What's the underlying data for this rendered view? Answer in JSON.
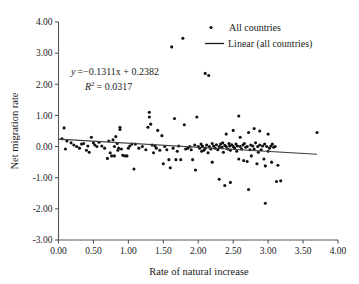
{
  "chart_data": {
    "type": "scatter",
    "title": "",
    "xlabel": "Rate of natural increase",
    "ylabel": "Net migration rate",
    "xlim": [
      0.0,
      4.0
    ],
    "ylim": [
      -3.0,
      4.0
    ],
    "xticks": [
      "0.00",
      "0.50",
      "1.00",
      "1.50",
      "2.00",
      "2.50",
      "3.00",
      "3.50",
      "4.00"
    ],
    "yticks": [
      "4.00",
      "3.00",
      "2.00",
      "1.00",
      "0.00",
      "-1.00",
      "-2.00",
      "-3.00"
    ],
    "grid": false,
    "legend_position": "top-right",
    "annotations": {
      "equation": "y = −0.1311x + 0.2382",
      "equation_y_var": "y",
      "equation_body": "=−0.1311x + 0.2382",
      "r_squared_var": "R",
      "r_squared_sup": "2",
      "r_squared_body": "= 0.0317",
      "r_squared": "R² = 0.0317"
    },
    "series": [
      {
        "name": "All countries",
        "marker": "point",
        "color": "#111111",
        "points": [
          [
            0.05,
            0.25
          ],
          [
            0.08,
            0.6
          ],
          [
            0.1,
            -0.08
          ],
          [
            0.12,
            0.18
          ],
          [
            0.18,
            0.12
          ],
          [
            0.22,
            0.05
          ],
          [
            0.26,
            0.0
          ],
          [
            0.3,
            -0.05
          ],
          [
            0.33,
            0.08
          ],
          [
            0.36,
            0.1
          ],
          [
            0.4,
            -0.12
          ],
          [
            0.42,
            0.02
          ],
          [
            0.44,
            -0.18
          ],
          [
            0.47,
            0.3
          ],
          [
            0.5,
            0.12
          ],
          [
            0.52,
            0.05
          ],
          [
            0.55,
            0.0
          ],
          [
            0.58,
            0.14
          ],
          [
            0.62,
            0.02
          ],
          [
            0.66,
            -0.05
          ],
          [
            0.7,
            -0.38
          ],
          [
            0.72,
            0.18
          ],
          [
            0.74,
            -0.2
          ],
          [
            0.76,
            -0.3
          ],
          [
            0.78,
            0.22
          ],
          [
            0.8,
            0.0
          ],
          [
            0.8,
            -0.3
          ],
          [
            0.82,
            0.32
          ],
          [
            0.84,
            0.1
          ],
          [
            0.85,
            -0.12
          ],
          [
            0.86,
            -0.05
          ],
          [
            0.88,
            0.62
          ],
          [
            0.88,
            0.55
          ],
          [
            0.9,
            -0.08
          ],
          [
            0.92,
            -0.28
          ],
          [
            0.95,
            -0.3
          ],
          [
            0.98,
            -0.3
          ],
          [
            1.0,
            -0.05
          ],
          [
            1.02,
            0.02
          ],
          [
            1.05,
            0.08
          ],
          [
            1.08,
            -0.72
          ],
          [
            1.1,
            0.08
          ],
          [
            1.15,
            -0.05
          ],
          [
            1.2,
            0.0
          ],
          [
            1.25,
            -0.1
          ],
          [
            1.28,
            0.62
          ],
          [
            1.3,
            1.1
          ],
          [
            1.3,
            0.95
          ],
          [
            1.32,
            0.72
          ],
          [
            1.34,
            0.05
          ],
          [
            1.36,
            -0.2
          ],
          [
            1.38,
            0.02
          ],
          [
            1.4,
            -0.05
          ],
          [
            1.42,
            0.52
          ],
          [
            1.45,
            -0.12
          ],
          [
            1.48,
            0.35
          ],
          [
            1.5,
            -0.55
          ],
          [
            1.52,
            0.0
          ],
          [
            1.55,
            -0.1
          ],
          [
            1.58,
            -0.42
          ],
          [
            1.6,
            -0.68
          ],
          [
            1.62,
            3.2
          ],
          [
            1.64,
            -0.05
          ],
          [
            1.66,
            0.9
          ],
          [
            1.68,
            -0.42
          ],
          [
            1.7,
            -0.15
          ],
          [
            1.72,
            0.02
          ],
          [
            1.75,
            -0.42
          ],
          [
            1.78,
            3.48
          ],
          [
            1.8,
            0.7
          ],
          [
            1.82,
            -0.08
          ],
          [
            1.85,
            -0.05
          ],
          [
            1.88,
            0.0
          ],
          [
            1.9,
            -0.1
          ],
          [
            1.92,
            -0.42
          ],
          [
            1.95,
            0.05
          ],
          [
            1.96,
            -0.75
          ],
          [
            1.98,
            0.95
          ],
          [
            2.0,
            0.0
          ],
          [
            2.02,
            -0.05
          ],
          [
            2.04,
            0.08
          ],
          [
            2.05,
            -0.15
          ],
          [
            2.06,
            0.02
          ],
          [
            2.08,
            -0.12
          ],
          [
            2.1,
            2.35
          ],
          [
            2.1,
            -0.05
          ],
          [
            2.12,
            0.05
          ],
          [
            2.14,
            -0.2
          ],
          [
            2.15,
            2.28
          ],
          [
            2.16,
            0.0
          ],
          [
            2.18,
            -0.08
          ],
          [
            2.2,
            0.1
          ],
          [
            2.2,
            -0.5
          ],
          [
            2.22,
            0.02
          ],
          [
            2.24,
            -0.05
          ],
          [
            2.26,
            0.06
          ],
          [
            2.28,
            -0.1
          ],
          [
            2.3,
            0.0
          ],
          [
            2.3,
            -1.05
          ],
          [
            2.32,
            0.08
          ],
          [
            2.34,
            -0.02
          ],
          [
            2.35,
            0.12
          ],
          [
            2.36,
            -0.18
          ],
          [
            2.38,
            0.04
          ],
          [
            2.38,
            -1.25
          ],
          [
            2.4,
            0.0
          ],
          [
            2.4,
            0.4
          ],
          [
            2.42,
            -0.08
          ],
          [
            2.44,
            0.1
          ],
          [
            2.45,
            0.02
          ],
          [
            2.46,
            -0.12
          ],
          [
            2.46,
            -1.15
          ],
          [
            2.48,
            0.06
          ],
          [
            2.5,
            0.0
          ],
          [
            2.5,
            0.52
          ],
          [
            2.52,
            -0.05
          ],
          [
            2.54,
            0.08
          ],
          [
            2.55,
            -0.15
          ],
          [
            2.56,
            0.02
          ],
          [
            2.58,
            -0.4
          ],
          [
            2.58,
            0.98
          ],
          [
            2.6,
            0.0
          ],
          [
            2.6,
            0.3
          ],
          [
            2.62,
            -0.08
          ],
          [
            2.64,
            0.05
          ],
          [
            2.65,
            -0.45
          ],
          [
            2.66,
            0.1
          ],
          [
            2.68,
            -0.02
          ],
          [
            2.7,
            0.0
          ],
          [
            2.7,
            -0.48
          ],
          [
            2.72,
            0.45
          ],
          [
            2.72,
            -1.38
          ],
          [
            2.74,
            -0.1
          ],
          [
            2.75,
            0.05
          ],
          [
            2.76,
            -0.3
          ],
          [
            2.78,
            0.02
          ],
          [
            2.8,
            0.58
          ],
          [
            2.8,
            -0.08
          ],
          [
            2.82,
            0.12
          ],
          [
            2.84,
            -0.55
          ],
          [
            2.85,
            0.0
          ],
          [
            2.86,
            -0.18
          ],
          [
            2.88,
            0.05
          ],
          [
            2.88,
            0.5
          ],
          [
            2.9,
            -0.1
          ],
          [
            2.92,
            0.02
          ],
          [
            2.94,
            -0.4
          ],
          [
            2.95,
            0.08
          ],
          [
            2.96,
            -1.82
          ],
          [
            2.96,
            -0.62
          ],
          [
            2.98,
            0.0
          ],
          [
            3.0,
            -0.15
          ],
          [
            3.0,
            0.4
          ],
          [
            3.02,
            -0.05
          ],
          [
            3.04,
            0.02
          ],
          [
            3.05,
            -0.5
          ],
          [
            3.06,
            0.08
          ],
          [
            3.08,
            -0.02
          ],
          [
            3.1,
            0.0
          ],
          [
            3.12,
            -1.12
          ],
          [
            3.14,
            -0.6
          ],
          [
            3.18,
            -1.1
          ],
          [
            3.7,
            0.45
          ]
        ]
      },
      {
        "name": "Linear (all countries)",
        "type": "line",
        "color": "#3b3c3f",
        "slope": -0.1311,
        "intercept": 0.2382,
        "x_start": 0.0,
        "x_end": 3.7,
        "y_start": 0.2382,
        "y_end": -0.2465
      }
    ],
    "legend": [
      {
        "label": "All countries",
        "marker": "point"
      },
      {
        "label": "Linear (all countries)",
        "marker": "line"
      }
    ]
  }
}
